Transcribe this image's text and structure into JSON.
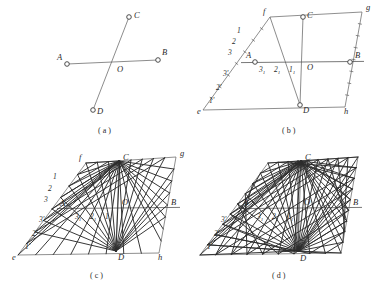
{
  "figure": {
    "background_color": "#ffffff",
    "ink_color": "#2a2a2a",
    "line_color": "#5a5a5a",
    "fan_color": "#2c2c2c"
  },
  "panels": [
    {
      "id": "a",
      "caption": "( a )",
      "caption_x": 98,
      "caption_y": 133,
      "origin": [
        0,
        0
      ],
      "description": "two intersecting straight lines AB and CD meeting at point O",
      "points": [
        {
          "name": "A",
          "label": "A",
          "x": 67,
          "y": 64,
          "label_dx": -10,
          "label_dy": -4,
          "marker": true
        },
        {
          "name": "B",
          "label": "B",
          "x": 158,
          "y": 60,
          "label_dx": 4,
          "label_dy": -5,
          "marker": true
        },
        {
          "name": "C",
          "label": "C",
          "x": 129,
          "y": 17,
          "label_dx": 5,
          "label_dy": 1,
          "marker": true
        },
        {
          "name": "D",
          "label": "D",
          "x": 93,
          "y": 110,
          "label_dx": 4,
          "label_dy": 4,
          "marker": true
        },
        {
          "name": "O",
          "label": "O",
          "x": 115,
          "y": 62,
          "label_dx": 2,
          "label_dy": 10,
          "marker": false
        }
      ],
      "segments": [
        {
          "from": "A",
          "to": "B"
        },
        {
          "from": "C",
          "to": "D"
        }
      ]
    },
    {
      "id": "b",
      "caption": "( b )",
      "caption_x": 282,
      "caption_y": 133,
      "description": "parallelogram efgh with side AB and CD divided into equal parts, divisions numbered",
      "corners": {
        "f": [
          270,
          17
        ],
        "g": [
          362,
          12
        ],
        "h": [
          345,
          107
        ],
        "e": [
          203,
          110
        ]
      },
      "corner_labels": [
        {
          "label": "f",
          "x": 263,
          "y": 14
        },
        {
          "label": "g",
          "x": 366,
          "y": 10
        },
        {
          "label": "h",
          "x": 344,
          "y": 114
        },
        {
          "label": "e",
          "x": 197,
          "y": 114
        }
      ],
      "points": [
        {
          "name": "A",
          "label": "A",
          "x": 255,
          "y": 62,
          "label_dx": -9,
          "label_dy": -4,
          "marker": true
        },
        {
          "name": "B",
          "label": "B",
          "x": 350,
          "y": 62,
          "label_dx": 5,
          "label_dy": -4,
          "marker": true
        },
        {
          "name": "C",
          "label": "C",
          "x": 303,
          "y": 17,
          "label_dx": 4,
          "label_dy": 1,
          "marker": true
        },
        {
          "name": "D",
          "label": "D",
          "x": 300,
          "y": 105,
          "label_dx": 3,
          "label_dy": 8,
          "marker": true
        },
        {
          "name": "O",
          "label": "O",
          "x": 303,
          "y": 62,
          "label_dx": 4,
          "label_dy": 8,
          "marker": false
        }
      ],
      "left_upper_divisions": [
        {
          "label": "1",
          "x": 237,
          "y": 33
        },
        {
          "label": "2",
          "x": 232,
          "y": 44
        },
        {
          "label": "3",
          "x": 228,
          "y": 55
        }
      ],
      "left_lower_divisions": [
        {
          "label": "3'",
          "x": 223,
          "y": 76
        },
        {
          "label": "2'",
          "x": 216,
          "y": 90
        },
        {
          "label": "1'",
          "x": 209,
          "y": 103
        }
      ],
      "ab_divisions": [
        {
          "label": "3",
          "sub": "1",
          "x": 259,
          "y": 72
        },
        {
          "label": "2",
          "sub": "1",
          "x": 274,
          "y": 72
        },
        {
          "label": "1",
          "sub": "1",
          "x": 289,
          "y": 72
        }
      ]
    },
    {
      "id": "c",
      "caption": "( c )",
      "caption_x": 90,
      "caption_y": 278,
      "description": "same parallelogram with pencils of rays drawn from C and from D to the numbered divisions, partially completed",
      "corners": {
        "f": [
          86,
          163
        ],
        "g": [
          176,
          157
        ],
        "h": [
          159,
          253
        ],
        "e": [
          18,
          255
        ]
      },
      "corner_labels": [
        {
          "label": "f",
          "x": 79,
          "y": 160
        },
        {
          "label": "g",
          "x": 180,
          "y": 156
        },
        {
          "label": "h",
          "x": 158,
          "y": 260
        },
        {
          "label": "e",
          "x": 12,
          "y": 260
        }
      ],
      "points": [
        {
          "name": "A",
          "label": "A",
          "x": 71,
          "y": 208,
          "label_dx": -11,
          "label_dy": -2,
          "marker": false
        },
        {
          "name": "B",
          "label": "B",
          "x": 166,
          "y": 208,
          "label_dx": 5,
          "label_dy": -3,
          "marker": false
        },
        {
          "name": "C",
          "label": "C",
          "x": 119,
          "y": 161,
          "label_dx": 4,
          "label_dy": -1,
          "marker": false
        },
        {
          "name": "D",
          "label": "D",
          "x": 116,
          "y": 251,
          "label_dx": 2,
          "label_dy": 9,
          "marker": false
        },
        {
          "name": "O",
          "label": "O",
          "x": 119,
          "y": 208,
          "label_dx": 3,
          "label_dy": -3,
          "marker": false
        }
      ],
      "left_upper_divisions": [
        {
          "label": "1",
          "x": 53,
          "y": 179
        },
        {
          "label": "2",
          "x": 48,
          "y": 191
        },
        {
          "label": "3",
          "x": 44,
          "y": 202
        }
      ],
      "left_lower_divisions": [
        {
          "label": "3'",
          "x": 39,
          "y": 222
        },
        {
          "label": "2'",
          "x": 32,
          "y": 236
        },
        {
          "label": "1'",
          "x": 25,
          "y": 249
        }
      ],
      "ab_divisions": [
        {
          "label": "3",
          "sub": "1",
          "x": 75,
          "y": 219
        },
        {
          "label": "2",
          "sub": "1",
          "x": 90,
          "y": 219
        },
        {
          "label": "1",
          "sub": "1",
          "x": 105,
          "y": 219
        }
      ]
    },
    {
      "id": "d",
      "caption": "( d )",
      "caption_x": 272,
      "caption_y": 278,
      "description": "completed construction: the two pencils of rays envelope a conic (ellipse) inscribed in the parallelogram",
      "corners": {
        "f": [
          268,
          163
        ],
        "g": [
          358,
          157
        ],
        "h": [
          341,
          253
        ],
        "e": [
          200,
          255
        ]
      },
      "corner_labels": [],
      "points": [
        {
          "name": "A",
          "label": "A",
          "x": 253,
          "y": 208,
          "label_dx": -10,
          "label_dy": -3,
          "marker": false
        },
        {
          "name": "B",
          "label": "B",
          "x": 348,
          "y": 208,
          "label_dx": 5,
          "label_dy": -3,
          "marker": false
        },
        {
          "name": "C",
          "label": "C",
          "x": 301,
          "y": 161,
          "label_dx": 4,
          "label_dy": -1,
          "marker": false
        },
        {
          "name": "D",
          "label": "D",
          "x": 298,
          "y": 251,
          "label_dx": 2,
          "label_dy": 10,
          "marker": false
        },
        {
          "name": "O",
          "label": "O",
          "x": 301,
          "y": 208,
          "label_dx": 3,
          "label_dy": -3,
          "marker": false
        }
      ],
      "left_upper_divisions": [],
      "left_lower_divisions": [
        {
          "label": "3'",
          "x": 221,
          "y": 222
        },
        {
          "label": "2'",
          "x": 214,
          "y": 236
        },
        {
          "label": "1'",
          "x": 207,
          "y": 249
        }
      ],
      "ab_divisions": [
        {
          "label": "3",
          "sub": "1",
          "x": 257,
          "y": 219
        },
        {
          "label": "2",
          "sub": "1",
          "x": 272,
          "y": 219
        },
        {
          "label": "1",
          "sub": "1",
          "x": 287,
          "y": 219
        }
      ]
    }
  ]
}
